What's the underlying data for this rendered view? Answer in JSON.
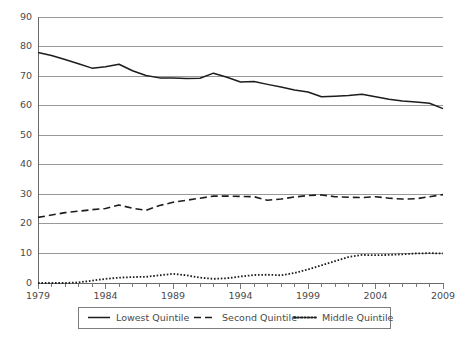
{
  "chart_data": {
    "type": "line",
    "title": "",
    "xlabel": "",
    "ylabel": "",
    "xlim": [
      1979,
      2009
    ],
    "ylim": [
      0,
      90
    ],
    "grid": "horizontal",
    "legend_position": "bottom",
    "y_ticks": [
      0,
      10,
      20,
      30,
      40,
      50,
      60,
      70,
      80,
      90
    ],
    "y_tick_labels": [
      "0",
      "10",
      "20",
      "30",
      "40",
      "50",
      "60",
      "70",
      "80",
      "90"
    ],
    "x_ticks": [
      1979,
      1980,
      1981,
      1982,
      1983,
      1984,
      1985,
      1986,
      1987,
      1988,
      1989,
      1990,
      1991,
      1992,
      1993,
      1994,
      1995,
      1996,
      1997,
      1998,
      1999,
      2000,
      2001,
      2002,
      2003,
      2004,
      2005,
      2006,
      2007,
      2008,
      2009
    ],
    "x_tick_labels": [
      "1979",
      "1984",
      "1989",
      "1994",
      "1999",
      "2004",
      "2009"
    ],
    "x_labeled_ticks": [
      1979,
      1984,
      1989,
      1994,
      1999,
      2004,
      2009
    ],
    "x": [
      1979,
      1980,
      1981,
      1982,
      1983,
      1984,
      1985,
      1986,
      1987,
      1988,
      1989,
      1990,
      1991,
      1992,
      1993,
      1994,
      1995,
      1996,
      1997,
      1998,
      1999,
      2000,
      2001,
      2002,
      2003,
      2004,
      2005,
      2006,
      2007,
      2008,
      2009
    ],
    "series": [
      {
        "name": "Lowest Quintile",
        "style": "solid",
        "color": "#1d1d1d",
        "values": [
          78.0,
          77.0,
          75.6,
          74.2,
          72.7,
          73.2,
          74.0,
          71.8,
          70.2,
          69.4,
          69.4,
          69.2,
          69.3,
          71.0,
          69.6,
          68.0,
          68.2,
          67.2,
          66.3,
          65.3,
          64.6,
          63.0,
          63.2,
          63.4,
          63.9,
          63.0,
          62.2,
          61.6,
          61.2,
          60.8,
          59.0
        ]
      },
      {
        "name": "Second Quintile",
        "style": "dashed",
        "color": "#1d1d1d",
        "values": [
          22.2,
          23.0,
          23.8,
          24.3,
          24.8,
          25.2,
          26.4,
          25.3,
          24.6,
          26.2,
          27.3,
          28.0,
          28.7,
          29.4,
          29.4,
          29.3,
          29.2,
          28.0,
          28.4,
          29.1,
          29.6,
          29.8,
          29.2,
          29.0,
          28.9,
          29.2,
          28.7,
          28.4,
          28.5,
          29.2,
          29.9
        ]
      },
      {
        "name": "Middle Quintile",
        "style": "dotted",
        "color": "#1d1d1d",
        "values": [
          0.0,
          0.0,
          0.0,
          0.2,
          0.8,
          1.4,
          1.8,
          2.0,
          2.1,
          2.6,
          3.1,
          2.6,
          1.8,
          1.4,
          1.6,
          2.2,
          2.7,
          2.8,
          2.6,
          3.4,
          4.6,
          6.0,
          7.4,
          8.8,
          9.5,
          9.4,
          9.5,
          9.7,
          10.0,
          10.1,
          10.0
        ]
      }
    ],
    "legend": [
      {
        "label": "Lowest Quintile",
        "style": "solid"
      },
      {
        "label": "Second Quintile",
        "style": "dashed"
      },
      {
        "label": "Middle Quintile",
        "style": "dotted"
      }
    ]
  }
}
